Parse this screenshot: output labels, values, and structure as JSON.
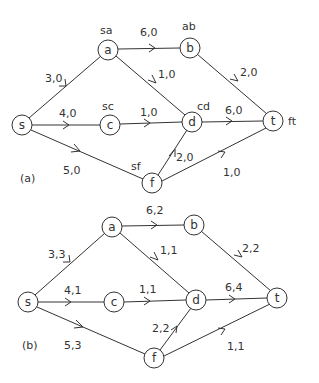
{
  "diagrams": [
    {
      "id": "a",
      "caption": "(a)",
      "nodes": [
        {
          "id": "s",
          "label": "s",
          "x": 22,
          "y": 125
        },
        {
          "id": "a",
          "label": "a",
          "x": 108,
          "y": 50,
          "tag": "sa"
        },
        {
          "id": "b",
          "label": "b",
          "x": 190,
          "y": 48,
          "tag": "ab"
        },
        {
          "id": "c",
          "label": "c",
          "x": 110,
          "y": 125,
          "tag": "sc"
        },
        {
          "id": "d",
          "label": "d",
          "x": 192,
          "y": 122,
          "tag": "cd"
        },
        {
          "id": "t",
          "label": "t",
          "x": 273,
          "y": 121,
          "tag": "ft"
        },
        {
          "id": "f",
          "label": "f",
          "x": 152,
          "y": 183,
          "tag": "sf"
        }
      ],
      "edges": [
        {
          "from": "s",
          "to": "a",
          "label": "3,0"
        },
        {
          "from": "s",
          "to": "c",
          "label": "4,0"
        },
        {
          "from": "s",
          "to": "f",
          "label": "5,0"
        },
        {
          "from": "a",
          "to": "b",
          "label": "6,0"
        },
        {
          "from": "a",
          "to": "d",
          "label": "1,0"
        },
        {
          "from": "c",
          "to": "d",
          "label": "1,0"
        },
        {
          "from": "b",
          "to": "t",
          "label": "2,0"
        },
        {
          "from": "d",
          "to": "t",
          "label": "6,0"
        },
        {
          "from": "f",
          "to": "d",
          "label": "2,0"
        },
        {
          "from": "f",
          "to": "t",
          "label": "1,0"
        }
      ]
    },
    {
      "id": "b",
      "caption": "(b)",
      "nodes": [
        {
          "id": "s",
          "label": "s",
          "x": 28,
          "y": 302
        },
        {
          "id": "a",
          "label": "a",
          "x": 112,
          "y": 227
        },
        {
          "id": "b",
          "label": "b",
          "x": 194,
          "y": 225
        },
        {
          "id": "c",
          "label": "c",
          "x": 114,
          "y": 302
        },
        {
          "id": "d",
          "label": "d",
          "x": 196,
          "y": 300
        },
        {
          "id": "t",
          "label": "t",
          "x": 277,
          "y": 298
        },
        {
          "id": "f",
          "label": "f",
          "x": 154,
          "y": 358
        }
      ],
      "edges": [
        {
          "from": "s",
          "to": "a",
          "label": "3,3"
        },
        {
          "from": "s",
          "to": "c",
          "label": "4,1"
        },
        {
          "from": "s",
          "to": "f",
          "label": "5,3"
        },
        {
          "from": "a",
          "to": "b",
          "label": "6,2"
        },
        {
          "from": "a",
          "to": "d",
          "label": "1,1"
        },
        {
          "from": "c",
          "to": "d",
          "label": "1,1"
        },
        {
          "from": "b",
          "to": "t",
          "label": "2,2"
        },
        {
          "from": "d",
          "to": "t",
          "label": "6,4"
        },
        {
          "from": "f",
          "to": "d",
          "label": "2,2"
        },
        {
          "from": "f",
          "to": "t",
          "label": "1,1"
        }
      ]
    }
  ]
}
